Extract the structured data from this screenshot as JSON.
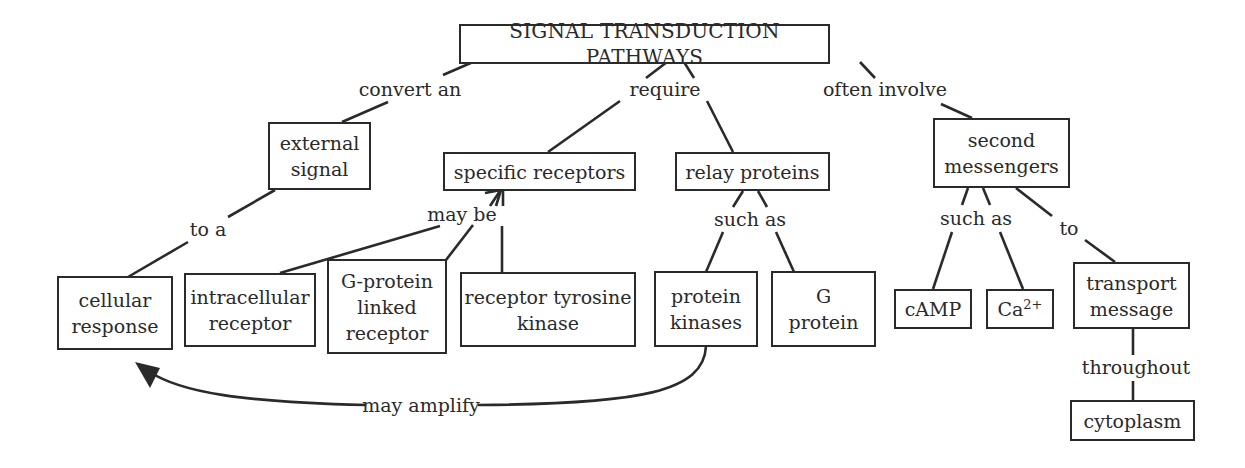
{
  "diagram": {
    "type": "concept-map",
    "title": "SIGNAL TRANSDUCTION PATHWAYS",
    "colors": {
      "ink": "#2a2a2a",
      "background": "#ffffff"
    },
    "nodes": {
      "root": "SIGNAL TRANSDUCTION PATHWAYS",
      "external_signal": "external\nsignal",
      "specific_receptors": "specific receptors",
      "relay_proteins": "relay proteins",
      "second_messengers": "second\nmessengers",
      "cellular_response": "cellular\nresponse",
      "intracellular_receptor": "intracellular\nreceptor",
      "g_protein_linked_receptor": "G-protein\nlinked\nreceptor",
      "receptor_tyrosine_kinase": "receptor tyrosine\nkinase",
      "protein_kinases": "protein\nkinases",
      "g_protein": "G\nprotein",
      "camp": "cAMP",
      "ca_base": "Ca",
      "ca_sup": "2+",
      "transport_message": "transport\nmessage",
      "cytoplasm": "cytoplasm"
    },
    "links": {
      "convert_an": "convert an",
      "require": "require",
      "often_involve": "often involve",
      "to_a": "to a",
      "may_be": "may be",
      "such_as_relay": "such as",
      "such_as_second": "such as",
      "to": "to",
      "throughout": "throughout",
      "may_amplify": "may amplify"
    }
  }
}
